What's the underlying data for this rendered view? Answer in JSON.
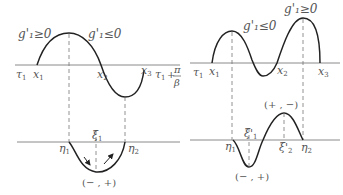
{
  "left_panel": {
    "upper": {
      "region_labels": [
        "g'₁≥0",
        "g'₁≤0"
      ],
      "axis_start_label": "τ",
      "axis_start_sub": "1",
      "points": [
        {
          "name": "x",
          "sub": "1"
        },
        {
          "name": "x",
          "sub": "2"
        },
        {
          "name": "x",
          "sub": "3"
        }
      ],
      "end_label": {
        "tau": "τ",
        "sub": "1",
        "plus": "+",
        "num": "π",
        "den": "β"
      }
    },
    "lower": {
      "points": [
        {
          "name": "η",
          "sub": "1"
        },
        {
          "name": "ξ",
          "sub": "1"
        },
        {
          "name": "η",
          "sub": "2"
        }
      ],
      "sign_label": "(− , +)"
    }
  },
  "right_panel": {
    "upper": {
      "region_labels": [
        "g'₁≤0",
        "g'₁≥0"
      ],
      "axis_start_label": "τ",
      "axis_start_sub": "1",
      "points": [
        {
          "name": "x",
          "sub": "1"
        },
        {
          "name": "x",
          "sub": "2"
        },
        {
          "name": "x",
          "sub": "3"
        }
      ]
    },
    "lower": {
      "points": [
        {
          "name": "η",
          "sub": "1"
        },
        {
          "name": "ξ'",
          "sub": "1"
        },
        {
          "name": "ξ'",
          "sub": "2"
        },
        {
          "name": "η",
          "sub": "2"
        }
      ],
      "sign_labels": [
        "(+ , −)",
        "(− , +)"
      ]
    }
  },
  "colors": {
    "curve": "#222222",
    "axis": "#8a8a8a",
    "text": "#555555"
  }
}
